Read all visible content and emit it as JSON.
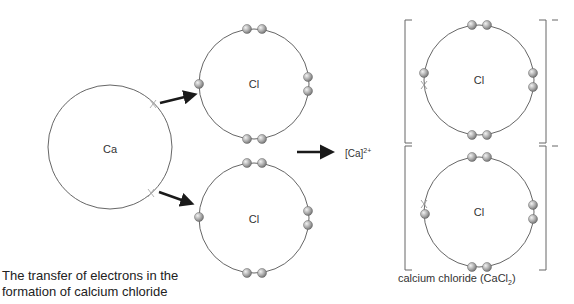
{
  "diagram": {
    "type": "ionic-bonding-dot-cross",
    "atoms": {
      "calcium": {
        "symbol": "Ca"
      },
      "chlorine_top": {
        "symbol": "Cl"
      },
      "chlorine_bottom": {
        "symbol": "Cl"
      }
    },
    "product_ion": {
      "text": "[Ca]",
      "charge": "2+"
    },
    "product_chlorides": {
      "top": {
        "symbol": "Cl",
        "charge": "−"
      },
      "bottom": {
        "symbol": "Cl",
        "charge": "−"
      }
    },
    "captions": {
      "main_line1": "The transfer of electrons in the",
      "main_line2": "formation of calcium chloride",
      "product": "calcium chloride (CaCl",
      "product_sub": "2",
      "product_end": ")"
    },
    "colors": {
      "shell": "#555555",
      "electron": "#9a9a9a",
      "arrow": "#1a1a1a",
      "bracket": "#666666"
    }
  }
}
